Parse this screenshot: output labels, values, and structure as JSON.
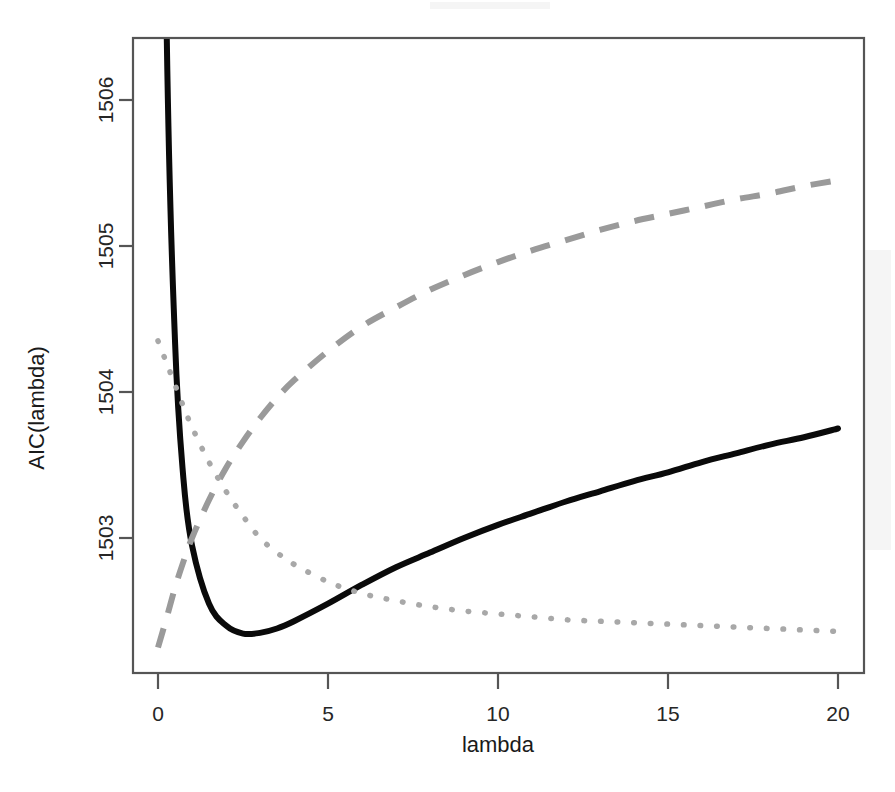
{
  "chart_data": {
    "type": "line",
    "title": "",
    "subtitle": "",
    "xlabel": "lambda",
    "ylabel": "AIC(lambda)",
    "xlim": [
      0,
      20
    ],
    "ylim": [
      1502.2,
      1506.45
    ],
    "grid": false,
    "legend": "none",
    "xticks": [
      0,
      5,
      10,
      15,
      20
    ],
    "xtick_labels": [
      "0",
      "5",
      "10",
      "15",
      "20"
    ],
    "yticks": [
      1503,
      1504,
      1505,
      1506
    ],
    "ytick_labels": [
      "1503",
      "1504",
      "1505",
      "1506"
    ],
    "x": [
      0,
      0.25,
      0.5,
      0.75,
      1,
      1.5,
      2,
      2.5,
      3,
      3.5,
      4,
      5,
      6,
      7,
      8,
      9,
      10,
      11,
      12,
      13,
      14,
      15,
      16,
      17,
      18,
      19,
      20
    ],
    "series": [
      {
        "name": "AIC(lambda)",
        "style": "solid",
        "color": "#0a0a0a",
        "values": [
          1512.2,
          1506.55,
          1504.35,
          1503.4,
          1502.95,
          1502.55,
          1502.4,
          1502.345,
          1502.35,
          1502.38,
          1502.43,
          1502.55,
          1502.68,
          1502.8,
          1502.9,
          1503.0,
          1503.09,
          1503.17,
          1503.25,
          1503.32,
          1503.39,
          1503.45,
          1503.52,
          1503.58,
          1503.64,
          1503.69,
          1503.75
        ]
      },
      {
        "name": "penalty term",
        "style": "dashed",
        "color": "#9a9a9a",
        "values": [
          1502.25,
          1502.45,
          1502.66,
          1502.84,
          1503.0,
          1503.26,
          1503.48,
          1503.66,
          1503.82,
          1503.96,
          1504.08,
          1504.28,
          1504.45,
          1504.58,
          1504.7,
          1504.8,
          1504.89,
          1504.97,
          1505.04,
          1505.11,
          1505.17,
          1505.22,
          1505.27,
          1505.32,
          1505.36,
          1505.41,
          1505.45
        ]
      },
      {
        "name": "goodness-of-fit term",
        "style": "dotted",
        "color": "#a8a8a8",
        "values": [
          1504.35,
          1504.2,
          1504.05,
          1503.9,
          1503.76,
          1503.52,
          1503.32,
          1503.15,
          1503.0,
          1502.9,
          1502.82,
          1502.7,
          1502.62,
          1502.57,
          1502.53,
          1502.5,
          1502.48,
          1502.46,
          1502.44,
          1502.43,
          1502.42,
          1502.41,
          1502.4,
          1502.39,
          1502.38,
          1502.37,
          1502.36
        ]
      }
    ],
    "annotations": []
  }
}
